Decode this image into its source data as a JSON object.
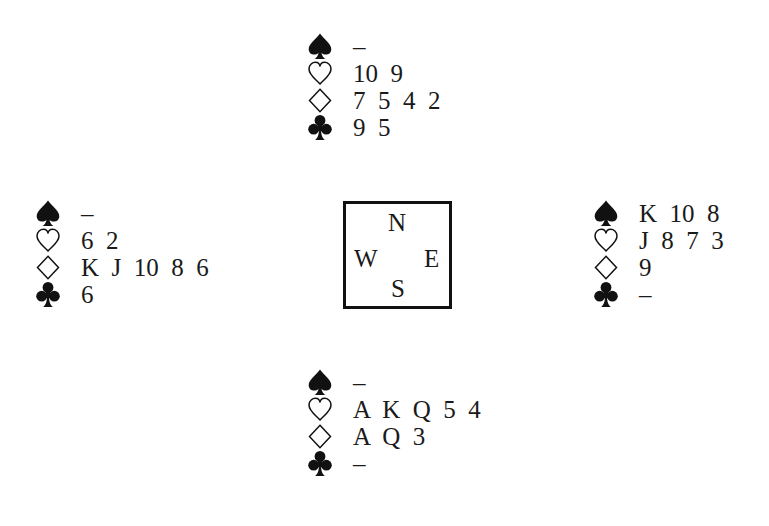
{
  "diagram": {
    "type": "bridge-deal",
    "compass": {
      "north": "N",
      "west": "W",
      "east": "E",
      "south": "S"
    },
    "suit_icons": {
      "spades": "spade-icon",
      "hearts": "heart-outline-icon",
      "diamonds": "diamond-outline-icon",
      "clubs": "club-icon"
    },
    "hands": {
      "north": {
        "spades": "–",
        "hearts": "10  9",
        "diamonds": "7  5  4  2",
        "clubs": "9  5"
      },
      "west": {
        "spades": "–",
        "hearts": "6  2",
        "diamonds": "K  J  10  8  6",
        "clubs": "6"
      },
      "east": {
        "spades": "K  10  8",
        "hearts": "J  8  7  3",
        "diamonds": "9",
        "clubs": "–"
      },
      "south": {
        "spades": "–",
        "hearts": "A  K  Q  5  4",
        "diamonds": "A  Q  3",
        "clubs": "–"
      }
    }
  }
}
